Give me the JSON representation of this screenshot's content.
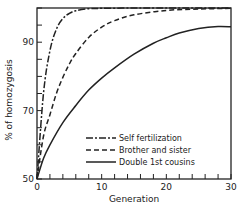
{
  "chart_data": {
    "type": "line",
    "title": "",
    "xlabel": "Generation",
    "ylabel": "% of homozygosis",
    "xlim": [
      0,
      30
    ],
    "ylim": [
      50,
      100
    ],
    "xticks": [
      0,
      10,
      20,
      30
    ],
    "xtick_labels": [
      "0",
      "10",
      "20",
      "30"
    ],
    "x_minor_step": 2,
    "yticks": [
      50,
      70,
      90
    ],
    "ytick_labels": [
      "50",
      "70",
      "90"
    ],
    "y_minor_step": 5,
    "grid": false,
    "legend_position": "lower-right",
    "series": [
      {
        "name": "Self fertilization",
        "style": "dash-dot",
        "x": [
          0,
          1,
          2,
          3,
          4,
          5,
          6,
          8,
          10,
          15,
          20,
          30
        ],
        "y": [
          50,
          75,
          87.5,
          93.8,
          96.9,
          98.4,
          99.2,
          99.8,
          99.9,
          100,
          100,
          100
        ]
      },
      {
        "name": "Brother and sister",
        "style": "dashed",
        "x": [
          0,
          1,
          2,
          3,
          4,
          5,
          6,
          8,
          10,
          12,
          15,
          20,
          25,
          30
        ],
        "y": [
          50,
          62.5,
          68.8,
          75,
          79.7,
          83.6,
          86.7,
          91.4,
          94.4,
          96.3,
          98,
          99.3,
          99.7,
          99.9
        ]
      },
      {
        "name": "Double 1st cousins",
        "style": "solid",
        "x": [
          0,
          1,
          2,
          4,
          6,
          8,
          10,
          12,
          15,
          18,
          20,
          22,
          25,
          28,
          30
        ],
        "y": [
          50,
          56,
          60,
          66.5,
          71.5,
          76,
          79.5,
          82.5,
          86.5,
          89.7,
          91.3,
          92.7,
          94,
          94.6,
          94.5
        ]
      }
    ]
  }
}
